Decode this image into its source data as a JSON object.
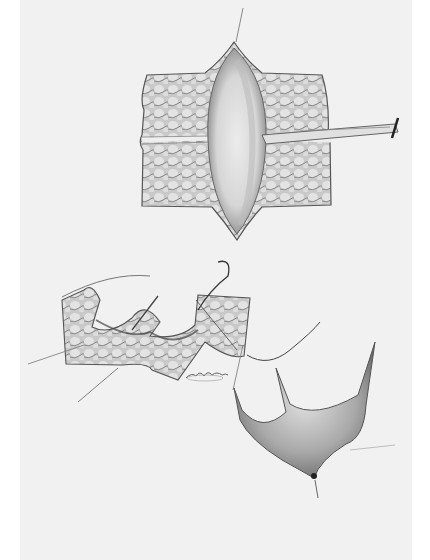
{
  "illustration": {
    "kind": "surgical line-and-wash illustration (grayscale)",
    "colors": {
      "page": "#ffffff",
      "plate": "#f1f1f1",
      "tissue_light": "#d8d8d8",
      "tissue_mid": "#a8a8a8",
      "tissue_dark": "#555555",
      "line": "#3a3a3a"
    },
    "figures": [
      {
        "id": "fig-1",
        "description": "Rectangular skin flap opened with a central elliptical incision, held by a retractor/forceps from the right"
      },
      {
        "id": "fig-2",
        "description": "Tissue flap being sutured with a curved needle and thread, traction sutures extending to the left"
      },
      {
        "id": "fig-3",
        "description": "Closed V-shaped flap with pointed corners after suturing"
      }
    ],
    "signature": "artist signature (illegible)"
  }
}
